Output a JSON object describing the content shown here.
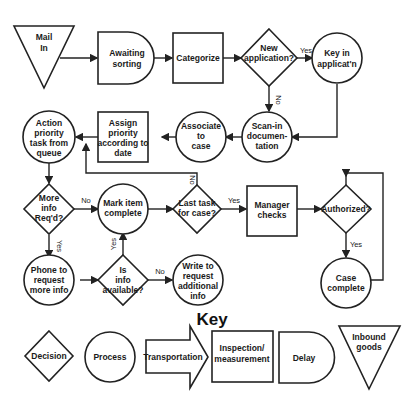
{
  "diagram": {
    "nodes": {
      "mail_in": {
        "type": "inbound-goods",
        "lines": [
          "Mail",
          "In"
        ]
      },
      "awaiting_sorting": {
        "type": "delay",
        "lines": [
          "Awaiting",
          "sorting"
        ]
      },
      "categorize": {
        "type": "inspection",
        "lines": [
          "Categorize"
        ]
      },
      "new_application": {
        "type": "decision",
        "lines": [
          "New",
          "application?"
        ]
      },
      "key_in": {
        "type": "process",
        "lines": [
          "Key in",
          "applicat'n"
        ]
      },
      "scan_in": {
        "type": "process",
        "lines": [
          "Scan-in",
          "documen-",
          "tation"
        ]
      },
      "associate": {
        "type": "process",
        "lines": [
          "Associate",
          "to",
          "case"
        ]
      },
      "assign_priority": {
        "type": "inspection",
        "lines": [
          "Assign",
          "priority",
          "according to",
          "date"
        ]
      },
      "action_priority": {
        "type": "process",
        "lines": [
          "Action",
          "priority",
          "task from",
          "queue"
        ]
      },
      "more_info": {
        "type": "decision",
        "lines": [
          "More",
          "info",
          "Req'd?"
        ]
      },
      "mark_complete": {
        "type": "process",
        "lines": [
          "Mark item",
          "complete"
        ]
      },
      "last_task": {
        "type": "decision",
        "lines": [
          "Last task",
          "for case?"
        ]
      },
      "manager_checks": {
        "type": "inspection",
        "lines": [
          "Manager",
          "checks"
        ]
      },
      "authorized": {
        "type": "decision",
        "lines": [
          "Authorized?"
        ]
      },
      "phone": {
        "type": "process",
        "lines": [
          "Phone to",
          "request",
          "more info"
        ]
      },
      "info_available": {
        "type": "decision",
        "lines": [
          "Is",
          "info",
          "available?"
        ]
      },
      "write_request": {
        "type": "process",
        "lines": [
          "Write to",
          "request",
          "additional",
          "info"
        ]
      },
      "case_complete": {
        "type": "process",
        "lines": [
          "Case",
          "complete"
        ]
      }
    },
    "edge_labels": {
      "new_app_yes": "Yes",
      "new_app_no": "No",
      "more_info_no": "No",
      "more_info_yes": "Yes",
      "info_avail_yes": "Yes",
      "info_avail_no": "No",
      "last_task_yes": "Yes",
      "last_task_no": "No",
      "authorized_yes": "Yes"
    }
  },
  "key": {
    "title": "Key",
    "items": [
      {
        "shape": "decision",
        "lines": [
          "Decision"
        ]
      },
      {
        "shape": "process",
        "lines": [
          "Process"
        ]
      },
      {
        "shape": "transportation",
        "lines": [
          "Transportation"
        ]
      },
      {
        "shape": "inspection",
        "lines": [
          "Inspection/",
          "measurement"
        ]
      },
      {
        "shape": "delay",
        "lines": [
          "Delay"
        ]
      },
      {
        "shape": "inbound",
        "lines": [
          "Inbound",
          "goods"
        ]
      }
    ]
  }
}
